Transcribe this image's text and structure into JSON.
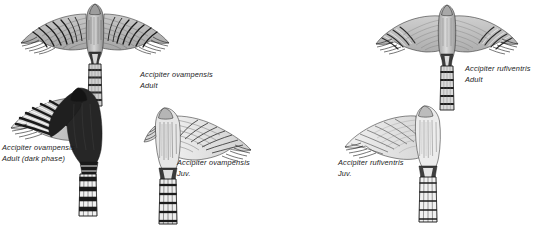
{
  "plate": {
    "background_color": "#ffffff",
    "ink_color": "#1b1b1b",
    "width": 549,
    "height": 226
  },
  "figures": [
    {
      "id": "ovampensis-adult",
      "name": "ovampo-sparrowhawk-adult-underwing",
      "posture": "spread wings, underside, tail down",
      "plumage": "pale grey with bold dark barring on flight feathers; heavily barred tail"
    },
    {
      "id": "ovampensis-adult-dark",
      "name": "ovampo-sparrowhawk-adult-dark-phase-underwing",
      "posture": "half-spread left wing, underside, tail down",
      "plumage": "sooty black body and coverts; boldly black-and-white barred remiges and tail"
    },
    {
      "id": "ovampensis-juvenile",
      "name": "ovampo-sparrowhawk-juvenile-underwing",
      "posture": "half-spread right wing, underside, tail down",
      "plumage": "pale finely streaked underparts; narrow dark bars on wing and tail"
    },
    {
      "id": "rufiventris-adult",
      "name": "rufous-breasted-sparrowhawk-adult-underwing",
      "posture": "spread wings, underside, tail down",
      "plumage": "plain pale grey underwing with fine dark barring confined to the outer wing; barred tail"
    },
    {
      "id": "rufiventris-juvenile",
      "name": "rufous-breasted-sparrowhawk-juvenile-underwing",
      "posture": "half-spread left wing, underside, tail down",
      "plumage": "pale, very finely barred underwing; narrowly barred tail"
    }
  ],
  "captions": [
    {
      "id": "caption-ovampensis-adult",
      "species": "Accipiter ovampensis",
      "age": "Adult"
    },
    {
      "id": "caption-ovampensis-adult-dark",
      "species": "Accipiter ovampensis",
      "age": "Adult (dark phase)"
    },
    {
      "id": "caption-ovampensis-juvenile",
      "species": "Accipiter ovampensis",
      "age": "Juv."
    },
    {
      "id": "caption-rufiventris-adult",
      "species": "Accipiter rufiventris",
      "age": "Adult"
    },
    {
      "id": "caption-rufiventris-juvenile",
      "species": "Accipiter rufiventris",
      "age": "Juv."
    }
  ]
}
